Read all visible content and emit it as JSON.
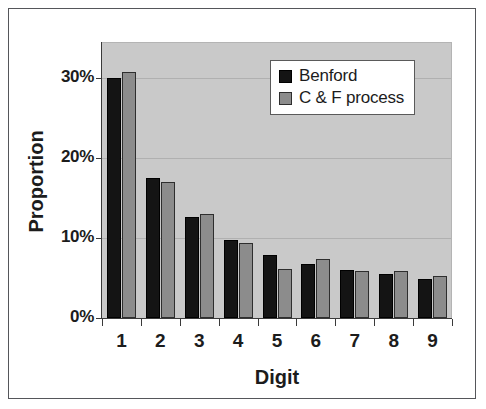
{
  "chart_data": {
    "type": "bar",
    "title": "",
    "xlabel": "Digit",
    "ylabel": "Proportion",
    "categories": [
      "1",
      "2",
      "3",
      "4",
      "5",
      "6",
      "7",
      "8",
      "9"
    ],
    "series": [
      {
        "name": "Benford",
        "color": "#141414",
        "values": [
          30.0,
          17.5,
          12.6,
          9.8,
          7.9,
          6.8,
          6.0,
          5.5,
          4.9
        ]
      },
      {
        "name": "C & F process",
        "color": "#8c8c8c",
        "values": [
          30.8,
          17.0,
          13.0,
          9.4,
          6.1,
          7.4,
          5.9,
          5.9,
          5.3
        ]
      }
    ],
    "ylim": [
      0,
      34.5
    ],
    "yticks": [
      0,
      10,
      20,
      30
    ],
    "ytick_labels": [
      "0%",
      "10%",
      "20%",
      "30%"
    ],
    "grid": true,
    "legend_position": "top-right",
    "plot_background": "#c9c9c9",
    "figure_background": "#ffffff"
  },
  "legend": {
    "entries": [
      {
        "label": "Benford"
      },
      {
        "label": "C & F process"
      }
    ]
  }
}
